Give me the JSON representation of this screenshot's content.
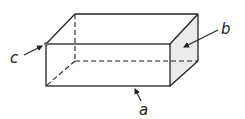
{
  "diagram": {
    "colors": {
      "edge": "#222222",
      "shaded_face": "#ebebeb",
      "background": "#ffffff",
      "vertex": "#666666"
    },
    "labels": {
      "a": "a",
      "b": "b",
      "c": "c"
    },
    "annotations": [
      {
        "label": "a",
        "points_to": "bottom edge of front face"
      },
      {
        "label": "b",
        "points_to": "right face (shaded)"
      },
      {
        "label": "c",
        "points_to": "top-left vertex of front face"
      }
    ]
  }
}
